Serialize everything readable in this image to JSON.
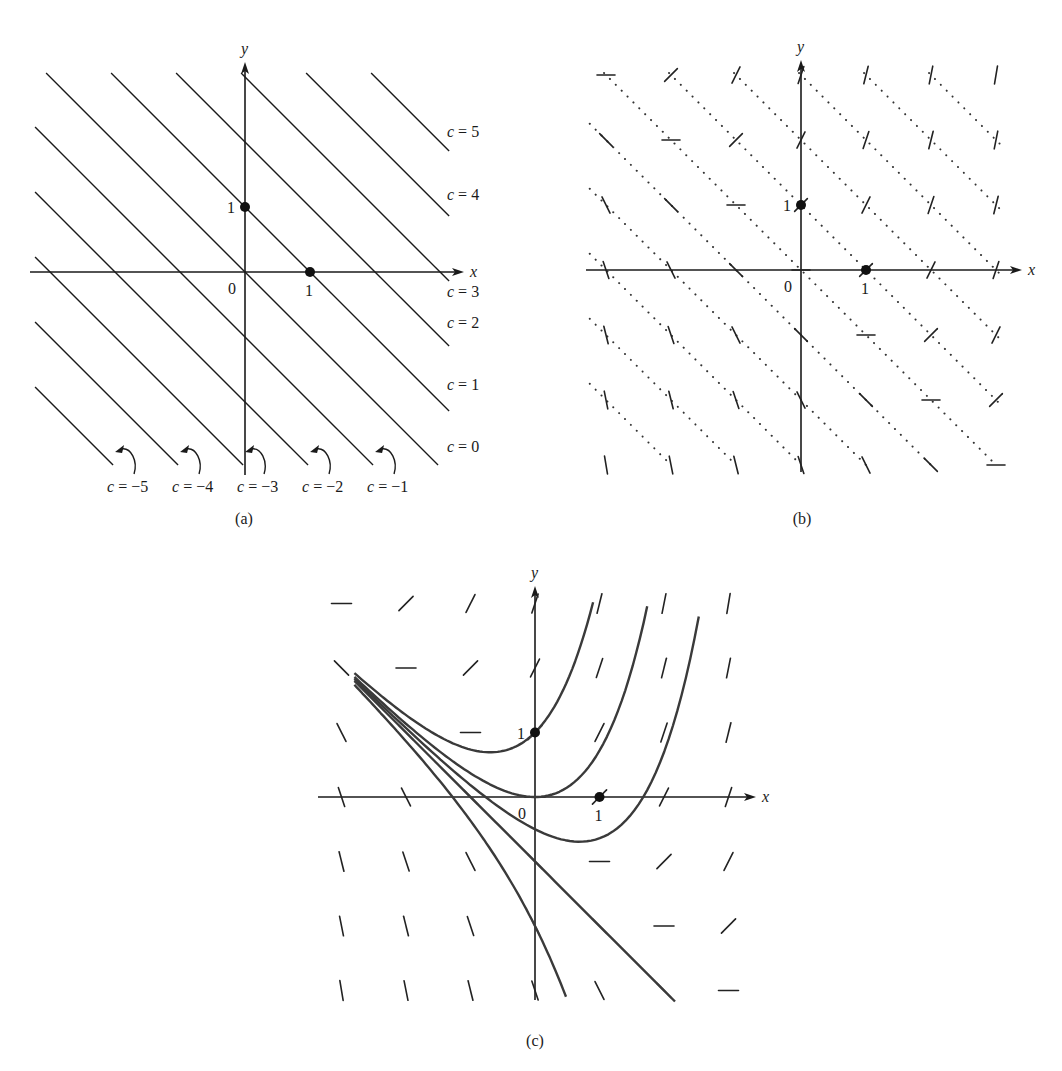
{
  "figure": {
    "equation_context": "direction field of y' = x + y with isoclines x + y = c",
    "panels": [
      {
        "id": "a",
        "caption": "(a)",
        "axis_labels": {
          "x": "x",
          "y": "y"
        },
        "tick_labels": {
          "origin": "0",
          "x_one": "1",
          "y_one": "1"
        },
        "marked_points": [
          [
            0,
            1
          ],
          [
            1,
            0
          ]
        ],
        "isoclines": [
          {
            "c": 5,
            "label": "c = 5"
          },
          {
            "c": 4,
            "label": "c = 4"
          },
          {
            "c": 3,
            "label": "c = 3"
          },
          {
            "c": 2,
            "label": "c = 2"
          },
          {
            "c": 1,
            "label": "c = 1"
          },
          {
            "c": 0,
            "label": "c = 0"
          },
          {
            "c": -1,
            "label": "c = −1"
          },
          {
            "c": -2,
            "label": "c = −2"
          },
          {
            "c": -3,
            "label": "c = −3"
          },
          {
            "c": -4,
            "label": "c = −4"
          },
          {
            "c": -5,
            "label": "c = −5"
          }
        ]
      },
      {
        "id": "b",
        "caption": "(b)",
        "axis_labels": {
          "x": "x",
          "y": "y"
        },
        "tick_labels": {
          "origin": "0",
          "x_one": "1",
          "y_one": "1"
        },
        "marked_points": [
          [
            0,
            1
          ],
          [
            1,
            0
          ]
        ],
        "isocline_style": "dotted",
        "slope_mark_grid": {
          "x": [
            -3,
            -2,
            -1,
            0,
            1,
            2,
            3
          ],
          "y": [
            -3,
            -2,
            -1,
            0,
            1,
            2,
            3
          ]
        }
      },
      {
        "id": "c",
        "caption": "(c)",
        "axis_labels": {
          "x": "x",
          "y": "y"
        },
        "tick_labels": {
          "origin": "0",
          "x_one": "1",
          "y_one": "1"
        },
        "marked_points": [
          [
            0,
            1
          ],
          [
            1,
            0
          ]
        ],
        "slope_mark_grid": {
          "x": [
            -3,
            -2,
            -1,
            0,
            1,
            2,
            3
          ],
          "y": [
            -3,
            -2,
            -1,
            0,
            1,
            2,
            3
          ]
        },
        "solution_curves": [
          {
            "name": "through (0,1)",
            "C": 2,
            "x_range": [
              -2.8,
              0.9
            ]
          },
          {
            "name": "through (0,0)",
            "C": 1,
            "x_range": [
              -2.8,
              1.74
            ]
          },
          {
            "name": "below axis",
            "C": 0.5,
            "x_range": [
              -2.8,
              2.54
            ]
          },
          {
            "name": "straight line y = -x - 1",
            "C": 0,
            "x_range": [
              -2.8,
              2.17
            ]
          },
          {
            "name": "concave down",
            "C": -1,
            "x_range": [
              -2.8,
              0.48
            ]
          }
        ]
      }
    ]
  },
  "chart_data": [
    {
      "type": "line",
      "title": "(a) Isoclines x + y = c",
      "xlabel": "x",
      "ylabel": "y",
      "series": [
        {
          "name": "c = 5",
          "equation": "y = 5 - x"
        },
        {
          "name": "c = 4",
          "equation": "y = 4 - x"
        },
        {
          "name": "c = 3",
          "equation": "y = 3 - x"
        },
        {
          "name": "c = 2",
          "equation": "y = 2 - x"
        },
        {
          "name": "c = 1",
          "equation": "y = 1 - x"
        },
        {
          "name": "c = 0",
          "equation": "y = -x"
        },
        {
          "name": "c = -1",
          "equation": "y = -1 - x"
        },
        {
          "name": "c = -2",
          "equation": "y = -2 - x"
        },
        {
          "name": "c = -3",
          "equation": "y = -3 - x"
        },
        {
          "name": "c = -4",
          "equation": "y = -4 - x"
        },
        {
          "name": "c = -5",
          "equation": "y = -5 - x"
        }
      ],
      "points": [
        {
          "x": 0,
          "y": 1
        },
        {
          "x": 1,
          "y": 0
        }
      ],
      "xlim": [
        -3.2,
        3.2
      ],
      "ylim": [
        -3,
        3.1
      ],
      "grid": false
    },
    {
      "type": "scatter",
      "title": "(b) Slope marks on isoclines, slope = x + y",
      "xlabel": "x",
      "ylabel": "y",
      "x": [
        -3,
        -2,
        -1,
        0,
        1,
        2,
        3
      ],
      "y": [
        -3,
        -2,
        -1,
        0,
        1,
        2,
        3
      ],
      "slope_rule": "x + y",
      "points": [
        {
          "x": 0,
          "y": 1
        },
        {
          "x": 1,
          "y": 0
        }
      ],
      "xlim": [
        -3.2,
        3.2
      ],
      "ylim": [
        -3,
        3.1
      ],
      "grid": false
    },
    {
      "type": "line",
      "title": "(c) Solution curves y = C e^x - x - 1 over direction field",
      "xlabel": "x",
      "ylabel": "y",
      "series": [
        {
          "name": "C = 2",
          "x": [
            -2.8,
            -2,
            -1,
            0,
            0.5,
            0.9
          ],
          "y": [
            1.96,
            1.27,
            0.74,
            1.0,
            1.8,
            3.02
          ]
        },
        {
          "name": "C = 1",
          "x": [
            -2.8,
            -2,
            -1,
            0,
            1,
            1.74
          ],
          "y": [
            1.86,
            1.14,
            0.37,
            0.0,
            0.72,
            2.96
          ]
        },
        {
          "name": "C = 0.5",
          "x": [
            -2.8,
            -2,
            -1,
            0,
            0.7,
            1.68,
            2.54
          ],
          "y": [
            1.83,
            1.07,
            0.18,
            -0.5,
            -0.69,
            0.0,
            2.8
          ]
        },
        {
          "name": "C = 0",
          "x": [
            -2.8,
            0,
            2.17
          ],
          "y": [
            1.8,
            -1.0,
            -3.17
          ]
        },
        {
          "name": "C = -1",
          "x": [
            -2.8,
            -2,
            -1,
            0,
            0.48
          ],
          "y": [
            1.74,
            0.86,
            -0.37,
            -2.0,
            -3.1
          ]
        }
      ],
      "points": [
        {
          "x": 0,
          "y": 1
        },
        {
          "x": 1,
          "y": 0
        }
      ],
      "xlim": [
        -3.2,
        3.2
      ],
      "ylim": [
        -3.2,
        3.2
      ],
      "grid": false
    }
  ]
}
